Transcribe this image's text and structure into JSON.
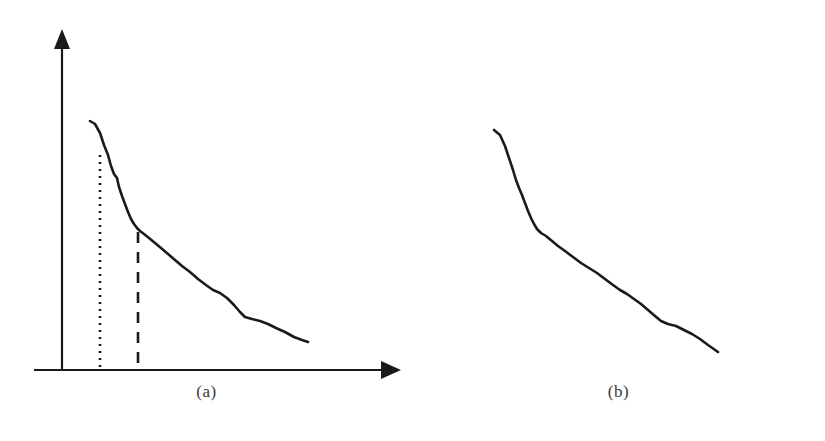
{
  "figure": {
    "background_color": "#ffffff",
    "stroke_color": "#1a1a1a",
    "caption_color": "#3a3a3a",
    "width": 825,
    "height": 441
  },
  "panels": [
    {
      "id": "a",
      "caption": "(a)",
      "axes": {
        "origin": [
          62,
          370
        ],
        "x_axis_end": [
          398,
          370
        ],
        "y_axis_top": [
          62,
          32
        ],
        "arrow_style": "filled-triangle",
        "x_label": "",
        "y_label": "",
        "ticks": [],
        "grid": false
      },
      "markers": [
        {
          "name": "dotted-threshold",
          "style": "dotted",
          "x": 100,
          "y_top": 155,
          "y_bottom": 370
        },
        {
          "name": "dashed-threshold",
          "style": "dashed",
          "x": 138,
          "y_top": 232,
          "y_bottom": 370
        }
      ]
    },
    {
      "id": "b",
      "caption": "(b)",
      "axes": {
        "origin": [
          43,
          370
        ],
        "x_axis_end": [
          376,
          370
        ],
        "y_axis_top": [
          43,
          32
        ],
        "arrow_style": "filled-triangle",
        "x_label": "",
        "y_label": "",
        "ticks": [],
        "grid": false
      },
      "markers": [
        {
          "name": "dashed-threshold",
          "style": "dashed",
          "x": 81,
          "y_top": 152,
          "y_bottom": 370
        },
        {
          "name": "dotted-threshold",
          "style": "dotted",
          "x": 121,
          "y_top": 232,
          "y_bottom": 370
        }
      ]
    }
  ],
  "chart_data": [
    {
      "type": "line",
      "title": "(a)",
      "xlabel": "",
      "ylabel": "",
      "xlim": [
        62,
        398
      ],
      "ylim": [
        370,
        32
      ],
      "grid": false,
      "legend": null,
      "series": [
        {
          "name": "decay-curve-a",
          "points": [
            [
              90,
              121
            ],
            [
              95,
              124
            ],
            [
              100,
              133
            ],
            [
              104,
              145
            ],
            [
              108,
              155
            ],
            [
              111,
              166
            ],
            [
              114,
              174
            ],
            [
              117,
              178
            ],
            [
              119,
              187
            ],
            [
              122,
              196
            ],
            [
              125,
              204
            ],
            [
              128,
              212
            ],
            [
              131,
              219
            ],
            [
              134,
              224
            ],
            [
              137,
              228
            ],
            [
              140,
              231
            ],
            [
              144,
              234
            ],
            [
              149,
              238
            ],
            [
              155,
              243
            ],
            [
              161,
              248
            ],
            [
              168,
              254
            ],
            [
              175,
              260
            ],
            [
              182,
              266
            ],
            [
              190,
              272
            ],
            [
              198,
              279
            ],
            [
              206,
              285
            ],
            [
              213,
              290
            ],
            [
              220,
              293
            ],
            [
              227,
              298
            ],
            [
              234,
              305
            ],
            [
              240,
              312
            ],
            [
              245,
              317
            ],
            [
              252,
              319
            ],
            [
              260,
              321
            ],
            [
              268,
              324
            ],
            [
              276,
              328
            ],
            [
              285,
              332
            ],
            [
              294,
              337
            ],
            [
              302,
              340
            ],
            [
              308,
              342
            ]
          ]
        }
      ],
      "annotations": [
        {
          "name": "dotted-threshold",
          "type": "vline",
          "style": "dotted",
          "x": 100
        },
        {
          "name": "dashed-threshold",
          "type": "vline",
          "style": "dashed",
          "x": 138
        }
      ]
    },
    {
      "type": "line",
      "title": "(b)",
      "xlabel": "",
      "ylabel": "",
      "xlim": [
        455,
        788
      ],
      "ylim": [
        370,
        32
      ],
      "grid": false,
      "legend": null,
      "series": [
        {
          "name": "decay-curve-b",
          "points": [
            [
              494,
              130
            ],
            [
              500,
              135
            ],
            [
              505,
              146
            ],
            [
              509,
              158
            ],
            [
              513,
              170
            ],
            [
              516,
              180
            ],
            [
              519,
              188
            ],
            [
              522,
              195
            ],
            [
              525,
              203
            ],
            [
              528,
              211
            ],
            [
              531,
              218
            ],
            [
              534,
              224
            ],
            [
              537,
              229
            ],
            [
              541,
              233
            ],
            [
              546,
              236
            ],
            [
              552,
              241
            ],
            [
              558,
              246
            ],
            [
              565,
              251
            ],
            [
              573,
              257
            ],
            [
              581,
              263
            ],
            [
              589,
              268
            ],
            [
              597,
              273
            ],
            [
              605,
              279
            ],
            [
              613,
              285
            ],
            [
              620,
              290
            ],
            [
              627,
              294
            ],
            [
              634,
              299
            ],
            [
              641,
              304
            ],
            [
              648,
              310
            ],
            [
              655,
              316
            ],
            [
              661,
              321
            ],
            [
              668,
              324
            ],
            [
              676,
              326
            ],
            [
              684,
              330
            ],
            [
              692,
              334
            ],
            [
              700,
              339
            ],
            [
              708,
              345
            ],
            [
              718,
              352
            ]
          ]
        }
      ],
      "annotations": [
        {
          "name": "dashed-threshold",
          "type": "vline",
          "style": "dashed",
          "x": 493
        },
        {
          "name": "dotted-threshold",
          "type": "vline",
          "style": "dotted",
          "x": 533
        }
      ]
    }
  ]
}
